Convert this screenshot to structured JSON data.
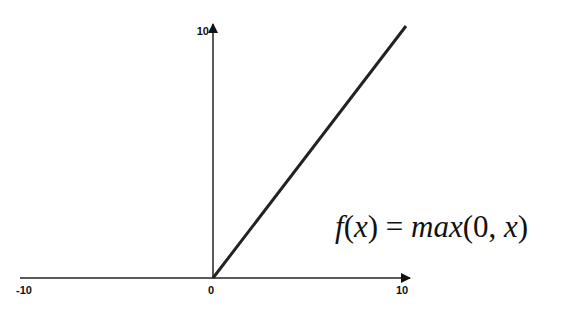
{
  "chart_data": {
    "type": "line",
    "title": "",
    "annotation": {
      "parts": [
        {
          "text": "f",
          "italic": true
        },
        {
          "text": "(",
          "italic": false
        },
        {
          "text": "x",
          "italic": true
        },
        {
          "text": ") = ",
          "italic": false
        },
        {
          "text": "max",
          "italic": true
        },
        {
          "text": "(0, ",
          "italic": false
        },
        {
          "text": "x",
          "italic": true
        },
        {
          "text": ")",
          "italic": false
        }
      ]
    },
    "xlim": [
      -10,
      10
    ],
    "ylim": [
      0,
      10
    ],
    "x_ticks": [
      {
        "value": -10,
        "label": "-10"
      },
      {
        "value": 0,
        "label": "0"
      },
      {
        "value": 10,
        "label": "10"
      }
    ],
    "y_ticks": [
      {
        "value": 10,
        "label": "10"
      }
    ],
    "grid": false,
    "series": [
      {
        "name": "ReLU",
        "color": "#222222",
        "x": [
          -10,
          0,
          10
        ],
        "y": [
          0,
          0,
          10
        ],
        "visible_segment": [
          [
            0,
            0
          ],
          [
            10,
            10
          ]
        ]
      }
    ]
  }
}
